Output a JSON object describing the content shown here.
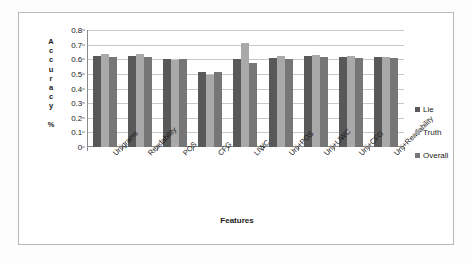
{
  "chart_data": {
    "type": "bar",
    "title": "",
    "xlabel": "Features",
    "ylabel": "Accuracy %",
    "ylim": [
      0,
      0.8
    ],
    "ytick_step": 0.1,
    "yticks": [
      "0.8",
      "0.7",
      "0.6",
      "0.5",
      "0.4",
      "0.3",
      "0.2",
      "0.1",
      "0"
    ],
    "grid": true,
    "legend_position": "right",
    "categories": [
      "Unigrams",
      "Readability",
      "POS",
      "CFG",
      "LIWC",
      "Uni+POS",
      "Uni+LIWC",
      "Uni+CFG",
      "Uni+Readability"
    ],
    "series": [
      {
        "name": "Lie",
        "color": "#595959",
        "values": [
          0.62,
          0.62,
          0.605,
          0.51,
          0.6,
          0.61,
          0.62,
          0.617,
          0.617
        ]
      },
      {
        "name": "Truth",
        "color": "#a9a9a9",
        "values": [
          0.635,
          0.635,
          0.597,
          0.495,
          0.71,
          0.625,
          0.627,
          0.623,
          0.617
        ]
      },
      {
        "name": "Overall",
        "color": "#767676",
        "values": [
          0.615,
          0.615,
          0.605,
          0.51,
          0.575,
          0.605,
          0.615,
          0.612,
          0.612
        ]
      }
    ]
  },
  "legend": {
    "items": [
      {
        "label": "Lie"
      },
      {
        "label": "Truth"
      },
      {
        "label": "Overall"
      }
    ]
  }
}
